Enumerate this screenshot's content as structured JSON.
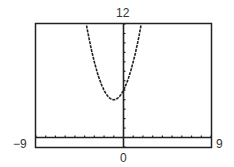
{
  "chart_data": {
    "type": "line",
    "title": "",
    "xlabel": "",
    "ylabel": "",
    "xlim": [
      -9,
      9
    ],
    "ylim": [
      -1,
      12
    ],
    "grid": false,
    "legend": "none",
    "tick_labels": {
      "x_min": "−9",
      "x_max": "9",
      "x_origin": "0",
      "y_max": "12"
    },
    "x_tick_step": 1,
    "y_tick_step": 1,
    "series": [
      {
        "name": "parabola",
        "equation": "y = (x+1)^2 + 4 (approx.)",
        "vertex": [
          -1,
          4
        ],
        "x": [
          -4.0,
          -3.5,
          -3.0,
          -2.5,
          -2.0,
          -1.5,
          -1.0,
          -0.5,
          0.0,
          0.5,
          1.0,
          1.8
        ],
        "values": [
          13.0,
          10.25,
          8.0,
          6.25,
          5.0,
          4.25,
          4.0,
          4.25,
          5.0,
          6.25,
          8.0,
          11.84
        ]
      }
    ]
  },
  "labels": {
    "y_max": "12",
    "x_min": "−9",
    "x_max": "9",
    "x_origin": "0"
  }
}
